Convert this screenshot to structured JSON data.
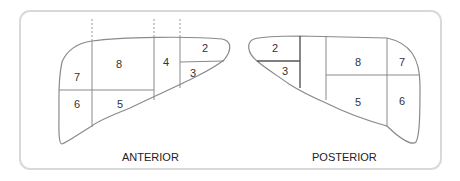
{
  "diagram": {
    "anterior": {
      "label": "ANTERIOR",
      "segments": [
        "2",
        "3",
        "4",
        "5",
        "6",
        "7",
        "8"
      ]
    },
    "posterior": {
      "label": "POSTERIOR",
      "segments": [
        "2",
        "3",
        "5",
        "6",
        "7",
        "8"
      ]
    }
  },
  "colors": {
    "outline": "#8a8a8a",
    "divider": "#8a8a8a",
    "divider_dark": "#555555",
    "frame": "#d9d9d9",
    "text": "#333333"
  }
}
